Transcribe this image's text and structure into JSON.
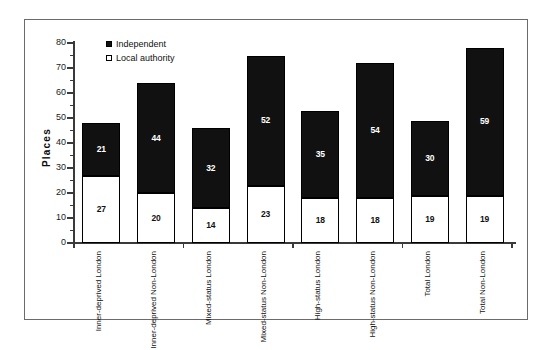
{
  "chart_data": {
    "type": "bar",
    "stacked": true,
    "title": "",
    "subtitle": "",
    "xlabel": "",
    "ylabel": "Places",
    "ylim": [
      0,
      80
    ],
    "ytick_step": 10,
    "yticks": [
      0,
      10,
      20,
      30,
      40,
      50,
      60,
      70,
      80
    ],
    "ytick_labels": [
      "0",
      "10",
      "20",
      "30",
      "40",
      "50",
      "60",
      "70",
      "80"
    ],
    "minor_ticks": true,
    "grid": false,
    "legend_position": "top-left-inside",
    "categories": [
      "Inner-deprived London",
      "Inner-deprived Non-London",
      "Mixed-status London",
      "Mixed-status Non-London",
      "High-status London",
      "High-status Non-London",
      "Total London",
      "Total Non-London"
    ],
    "category_lines": [
      [
        "Inner-deprived",
        "London"
      ],
      [
        "Inner-deprived",
        "Non-London"
      ],
      [
        "Mixed-status",
        "London"
      ],
      [
        "Mixed-status",
        "Non-London"
      ],
      [
        "High-status",
        "London"
      ],
      [
        "High-status",
        "Non-London"
      ],
      [
        "Total",
        "London"
      ],
      [
        "Total",
        "Non-London"
      ]
    ],
    "series": [
      {
        "name": "Local authority",
        "color": "#ffffff",
        "marker": "open-square",
        "values": [
          27,
          20,
          14,
          23,
          18,
          18,
          19,
          19
        ]
      },
      {
        "name": "Independent",
        "color": "#111111",
        "marker": "filled-square",
        "values": [
          21,
          44,
          32,
          52,
          35,
          54,
          30,
          59
        ]
      }
    ],
    "totals": [
      48,
      64,
      46,
      75,
      53,
      72,
      49,
      78
    ]
  },
  "legend": {
    "items": [
      {
        "label": "Independent",
        "marker": "filled-square"
      },
      {
        "label": "Local authority",
        "marker": "open-square"
      }
    ]
  },
  "axis": {
    "y_title": "Places"
  },
  "colors": {
    "independent": "#111111",
    "local_authority": "#ffffff",
    "axis": "#3a3a3a",
    "frame": "#6b6b6b",
    "background": "#ffffff"
  }
}
